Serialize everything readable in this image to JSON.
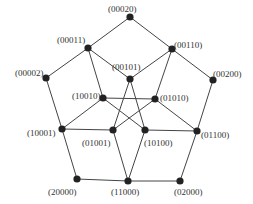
{
  "diagram": {
    "edge_color": "#444444",
    "node_color": "#222222",
    "nodes": [
      {
        "id": "00020",
        "label": "(00020)",
        "x": 130,
        "y": 17,
        "lx": 108,
        "ly": 9
      },
      {
        "id": "00011",
        "label": "(00011)",
        "x": 88,
        "y": 48,
        "lx": 57,
        "ly": 40
      },
      {
        "id": "00110",
        "label": "(00110)",
        "x": 172,
        "y": 49,
        "lx": 174,
        "ly": 45
      },
      {
        "id": "00002",
        "label": "(00002)",
        "x": 46,
        "y": 78,
        "lx": 15,
        "ly": 73
      },
      {
        "id": "00200",
        "label": "(00200)",
        "x": 213,
        "y": 80,
        "lx": 213,
        "ly": 74
      },
      {
        "id": "00101",
        "label": "(00101)",
        "x": 130,
        "y": 79,
        "lx": 112,
        "ly": 67
      },
      {
        "id": "10010",
        "label": "(10010)",
        "x": 103,
        "y": 98,
        "lx": 72,
        "ly": 96
      },
      {
        "id": "01010",
        "label": "(01010)",
        "x": 155,
        "y": 99,
        "lx": 160,
        "ly": 98
      },
      {
        "id": "10001",
        "label": "(10001)",
        "x": 62,
        "y": 129,
        "lx": 27,
        "ly": 133
      },
      {
        "id": "01001",
        "label": "(01001)",
        "x": 113,
        "y": 130,
        "lx": 82,
        "ly": 143
      },
      {
        "id": "10100",
        "label": "(10100)",
        "x": 145,
        "y": 130,
        "lx": 144,
        "ly": 143
      },
      {
        "id": "01100",
        "label": "(01100)",
        "x": 197,
        "y": 131,
        "lx": 201,
        "ly": 135
      },
      {
        "id": "20000",
        "label": "(20000)",
        "x": 77,
        "y": 179,
        "lx": 48,
        "ly": 192
      },
      {
        "id": "11000",
        "label": "(11000)",
        "x": 128,
        "y": 181,
        "lx": 111,
        "ly": 192
      },
      {
        "id": "02000",
        "label": "(02000)",
        "x": 180,
        "y": 181,
        "lx": 174,
        "ly": 192
      }
    ],
    "edges": [
      [
        "00020",
        "00011"
      ],
      [
        "00020",
        "00110"
      ],
      [
        "00011",
        "00002"
      ],
      [
        "00011",
        "00101"
      ],
      [
        "00011",
        "10010"
      ],
      [
        "00110",
        "00101"
      ],
      [
        "00110",
        "00200"
      ],
      [
        "00110",
        "01010"
      ],
      [
        "00002",
        "10001"
      ],
      [
        "00200",
        "01100"
      ],
      [
        "00101",
        "01001"
      ],
      [
        "00101",
        "10100"
      ],
      [
        "10010",
        "01010"
      ],
      [
        "10010",
        "10001"
      ],
      [
        "10010",
        "10100"
      ],
      [
        "01010",
        "01001"
      ],
      [
        "01010",
        "01100"
      ],
      [
        "10001",
        "01001"
      ],
      [
        "10001",
        "20000"
      ],
      [
        "10100",
        "01100"
      ],
      [
        "01001",
        "11000"
      ],
      [
        "10100",
        "11000"
      ],
      [
        "01100",
        "02000"
      ],
      [
        "20000",
        "11000"
      ],
      [
        "11000",
        "02000"
      ]
    ]
  }
}
